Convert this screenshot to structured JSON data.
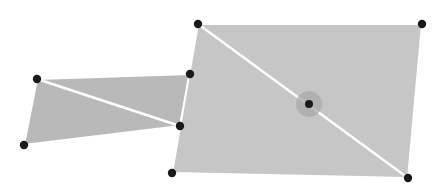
{
  "canvas": {
    "width": 436,
    "height": 194,
    "background": "#ffffff"
  },
  "colors": {
    "fill_large": "#c6c6c6",
    "fill_small": "#b9b9b9",
    "edge_highlight": "#ffffff",
    "diagonal": "#ffffff",
    "handle": "#1a1a1a",
    "center_halo": "#a8a8a8"
  },
  "shapes": [
    {
      "id": "small-quad",
      "vertices": [
        [
          37,
          79
        ],
        [
          190,
          74
        ],
        [
          180,
          126
        ],
        [
          24,
          145
        ]
      ],
      "diagonal": [
        [
          37,
          79
        ],
        [
          180,
          126
        ]
      ]
    },
    {
      "id": "large-quad",
      "vertices": [
        [
          198,
          24
        ],
        [
          422,
          24
        ],
        [
          408,
          178
        ],
        [
          172,
          173
        ]
      ],
      "diagonal": [
        [
          198,
          24
        ],
        [
          408,
          178
        ]
      ],
      "center_handle": {
        "x": 309,
        "y": 104,
        "halo_radius": 13
      }
    }
  ],
  "handles": [
    {
      "name": "small-quad-top-left",
      "x": 37,
      "y": 79
    },
    {
      "name": "small-quad-top-right",
      "x": 190,
      "y": 74
    },
    {
      "name": "small-quad-bottom-right",
      "x": 180,
      "y": 126
    },
    {
      "name": "small-quad-bottom-left",
      "x": 24,
      "y": 145
    },
    {
      "name": "large-quad-top-left",
      "x": 198,
      "y": 24
    },
    {
      "name": "large-quad-top-right",
      "x": 422,
      "y": 24
    },
    {
      "name": "large-quad-bottom-right",
      "x": 408,
      "y": 178
    },
    {
      "name": "large-quad-bottom-left",
      "x": 172,
      "y": 173
    }
  ]
}
